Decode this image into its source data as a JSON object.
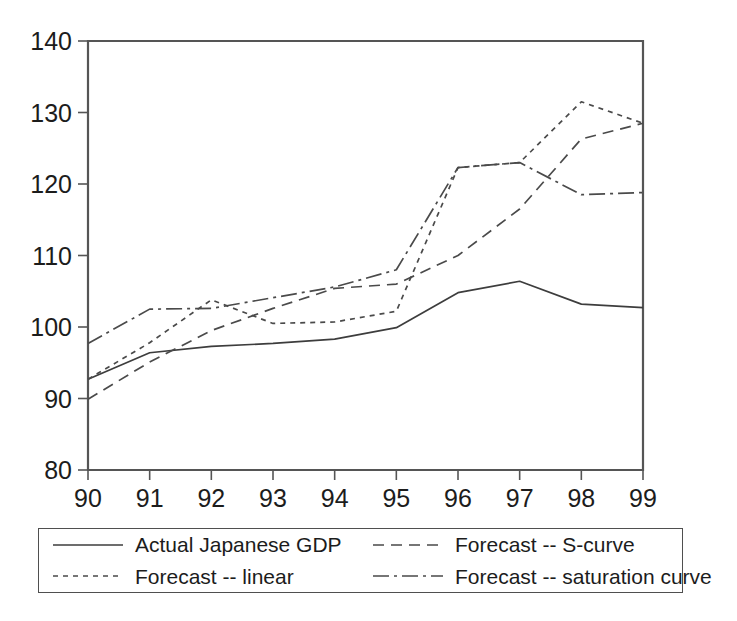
{
  "chart_data": {
    "type": "line",
    "title": "",
    "subtitle": "",
    "xlabel": "",
    "ylabel": "",
    "x": [
      "90",
      "91",
      "92",
      "93",
      "94",
      "95",
      "96",
      "97",
      "98",
      "99"
    ],
    "xlim": [
      90,
      99
    ],
    "ylim": [
      80,
      140
    ],
    "yticks": [
      80,
      90,
      100,
      110,
      120,
      130,
      140
    ],
    "xticks": [
      "90",
      "91",
      "92",
      "93",
      "94",
      "95",
      "96",
      "97",
      "98",
      "99"
    ],
    "grid": false,
    "legend_position": "bottom",
    "series": [
      {
        "name": "Actual Japanese GDP",
        "style": "solid",
        "values": [
          92.7,
          96.4,
          97.3,
          97.7,
          98.3,
          99.9,
          104.8,
          106.4,
          103.2,
          102.7
        ]
      },
      {
        "name": "Forecast -- S-curve",
        "style": "dashed",
        "values": [
          89.9,
          95.1,
          99.5,
          102.6,
          105.4,
          106.0,
          110.0,
          116.5,
          126.3,
          128.5
        ]
      },
      {
        "name": "Forecast -- linear",
        "style": "dotted",
        "values": [
          92.7,
          97.8,
          103.8,
          100.5,
          100.7,
          102.2,
          122.3,
          123.0,
          131.5,
          128.5
        ]
      },
      {
        "name": "Forecast -- saturation curve",
        "style": "dash-dot",
        "values": [
          97.7,
          102.5,
          102.6,
          104.1,
          105.6,
          108.0,
          122.3,
          123.0,
          118.5,
          118.8
        ]
      }
    ]
  },
  "axes": {
    "y_tick_labels": [
      "140",
      "130",
      "120",
      "110",
      "100",
      "90",
      "80"
    ],
    "x_tick_labels": [
      "90",
      "91",
      "92",
      "93",
      "94",
      "95",
      "96",
      "97",
      "98",
      "99"
    ]
  },
  "legend": {
    "entries": [
      {
        "label": "Actual Japanese GDP",
        "style": "solid"
      },
      {
        "label": "Forecast -- S-curve",
        "style": "dashed"
      },
      {
        "label": "Forecast -- linear",
        "style": "dotted"
      },
      {
        "label": "Forecast -- saturation curve",
        "style": "dash-dot"
      }
    ]
  }
}
